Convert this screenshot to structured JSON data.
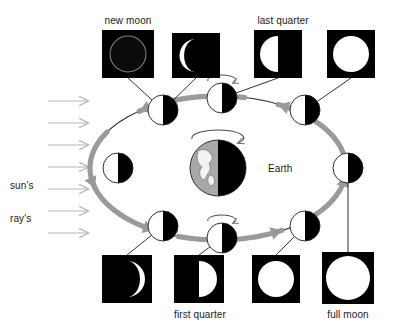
{
  "diagram": {
    "colors": {
      "background": "#ffffff",
      "text": "#1a1a1a",
      "moon_dark": "#000000",
      "moon_light": "#ffffff",
      "photo_frame": "#000000",
      "orbit_arrow": "#9a9a9a",
      "sun_ray": "#b4b4b4",
      "earth_lit": "#a8a8a8",
      "earth_dark": "#000000",
      "leader_line": "#1a1a1a"
    },
    "labels": {
      "new_moon": "new moon",
      "last_quarter": "last quarter",
      "first_quarter": "first quarter",
      "full_moon": "full moon",
      "earth": "Earth",
      "suns_rays_line1": "sun's",
      "suns_rays_line2": "ray's"
    },
    "center_body": {
      "name": "Earth",
      "cx": 218,
      "cy": 168,
      "r": 28,
      "lit_side": "left",
      "label_x": 268,
      "label_y": 163,
      "rotation_indicator": true
    },
    "sun_rays": {
      "count": 7,
      "direction": "left-to-right",
      "x_start": 48,
      "x_end": 88,
      "y_first": 101,
      "y_spacing": 22,
      "label_x": 10,
      "label_y": 158
    },
    "orbit": {
      "cx": 218,
      "cy": 168,
      "rx": 128,
      "ry": 72,
      "direction": "counterclockwise",
      "arrow_color": "#9a9a9a"
    },
    "orbit_moons": [
      {
        "id": "moon-top-left",
        "cx": 163,
        "cy": 110,
        "r": 15,
        "lit_side": "left",
        "rotation_indicator": false
      },
      {
        "id": "moon-top-center",
        "cx": 222,
        "cy": 98,
        "r": 15,
        "lit_side": "left",
        "rotation_indicator": true
      },
      {
        "id": "moon-top-right",
        "cx": 305,
        "cy": 110,
        "r": 15,
        "lit_side": "left",
        "rotation_indicator": false
      },
      {
        "id": "moon-right",
        "cx": 348,
        "cy": 168,
        "r": 15,
        "lit_side": "left",
        "rotation_indicator": false
      },
      {
        "id": "moon-bottom-right",
        "cx": 305,
        "cy": 226,
        "r": 15,
        "lit_side": "left",
        "rotation_indicator": false
      },
      {
        "id": "moon-bottom-center",
        "cx": 222,
        "cy": 238,
        "r": 15,
        "lit_side": "left",
        "rotation_indicator": true
      },
      {
        "id": "moon-bottom-left",
        "cx": 163,
        "cy": 226,
        "r": 15,
        "lit_side": "left",
        "rotation_indicator": false
      },
      {
        "id": "moon-left",
        "cx": 118,
        "cy": 168,
        "r": 15,
        "lit_side": "left",
        "rotation_indicator": false
      }
    ],
    "photos": [
      {
        "id": "photo-new-moon",
        "phase": "new moon",
        "row": "top",
        "x": 102,
        "y": 30,
        "w": 52,
        "h": 48,
        "render": "dark-disc-outline",
        "label": "new moon",
        "label_x": 128,
        "label_y": 15,
        "leader_to": {
          "x": 163,
          "y": 110
        }
      },
      {
        "id": "photo-waxing-crescent-top",
        "phase": "waning crescent",
        "row": "top",
        "x": 172,
        "y": 33,
        "w": 48,
        "h": 45,
        "render": "crescent-left",
        "label": "",
        "leader_to": {
          "x": 163,
          "y": 110
        }
      },
      {
        "id": "photo-last-quarter",
        "phase": "last quarter",
        "row": "top",
        "x": 254,
        "y": 30,
        "w": 48,
        "h": 48,
        "render": "half-left",
        "label": "last quarter",
        "label_x": 283,
        "label_y": 15,
        "leader_to": {
          "x": 222,
          "y": 98
        }
      },
      {
        "id": "photo-waning-gibbous-top",
        "phase": "waning gibbous",
        "row": "top",
        "x": 327,
        "y": 30,
        "w": 48,
        "h": 48,
        "render": "full-disc",
        "label": "",
        "leader_to": {
          "x": 305,
          "y": 110
        }
      },
      {
        "id": "photo-waxing-crescent-bottom",
        "phase": "waxing crescent",
        "row": "bottom",
        "x": 102,
        "y": 255,
        "w": 50,
        "h": 48,
        "render": "crescent-right",
        "label": "",
        "leader_to": {
          "x": 163,
          "y": 226
        }
      },
      {
        "id": "photo-first-quarter",
        "phase": "first quarter",
        "row": "bottom",
        "x": 174,
        "y": 255,
        "w": 50,
        "h": 48,
        "render": "half-right",
        "label": "first quarter",
        "label_x": 200,
        "label_y": 309,
        "leader_to": {
          "x": 222,
          "y": 238
        }
      },
      {
        "id": "photo-waxing-gibbous-bottom",
        "phase": "waxing gibbous",
        "row": "bottom",
        "x": 252,
        "y": 255,
        "w": 48,
        "h": 48,
        "render": "full-disc",
        "label": "",
        "leader_to": {
          "x": 305,
          "y": 226
        }
      },
      {
        "id": "photo-full-moon",
        "phase": "full moon",
        "row": "bottom",
        "x": 322,
        "y": 252,
        "w": 52,
        "h": 52,
        "render": "full-disc-large",
        "label": "full moon",
        "label_x": 348,
        "label_y": 309,
        "leader_to": {
          "x": 348,
          "y": 168
        }
      }
    ]
  }
}
